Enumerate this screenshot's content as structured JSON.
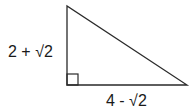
{
  "diagram": {
    "type": "right-triangle",
    "labels": {
      "vertical_leg": "2 + √2",
      "horizontal_leg": "4 - √2"
    },
    "right_angle_marker": true,
    "stroke_color": "#2a2a2a"
  }
}
